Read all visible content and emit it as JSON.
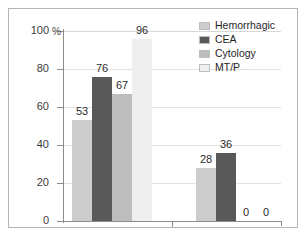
{
  "chart_data": {
    "type": "bar",
    "title": "",
    "subtitle": "",
    "xlabel": "",
    "ylabel": "%",
    "ylim": [
      0,
      100
    ],
    "yticks": [
      0,
      20,
      40,
      60,
      80,
      100
    ],
    "grid": true,
    "legend_position": "top-right",
    "categories": [
      "Group 1",
      "Group 2"
    ],
    "series": [
      {
        "name": "Hemorrhagic",
        "color": "#cccccc",
        "values": [
          53,
          28
        ]
      },
      {
        "name": "CEA",
        "color": "#595959",
        "values": [
          76,
          36
        ]
      },
      {
        "name": "Cytology",
        "color": "#bdbdbd",
        "values": [
          67,
          0
        ]
      },
      {
        "name": "MT/P",
        "color": "#efefef",
        "values": [
          96,
          0
        ]
      }
    ],
    "data_labels": [
      "53",
      "76",
      "67",
      "96",
      "28",
      "36",
      "0",
      "0"
    ]
  },
  "axis": {
    "percent_symbol": "%",
    "tick_labels": [
      "100",
      "80",
      "60",
      "40",
      "20",
      "0"
    ]
  },
  "legend": {
    "items": [
      {
        "label": "Hemorrhagic",
        "color": "#cccccc"
      },
      {
        "label": "CEA",
        "color": "#595959"
      },
      {
        "label": "Cytology",
        "color": "#bdbdbd"
      },
      {
        "label": "MT/P",
        "color": "#efefef"
      }
    ]
  }
}
